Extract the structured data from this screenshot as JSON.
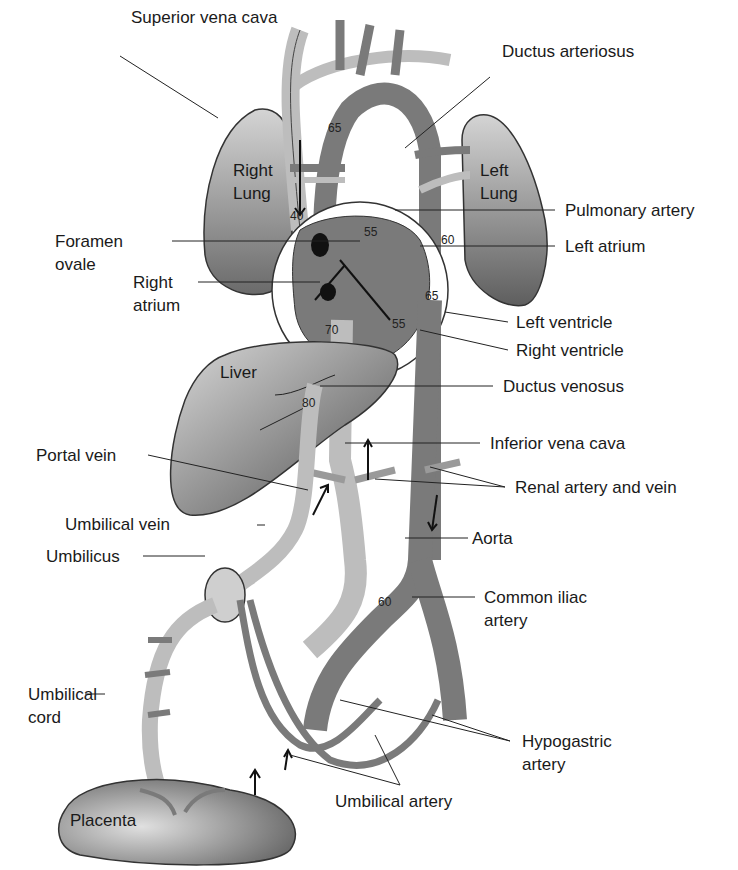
{
  "diagram": {
    "labels": {
      "superior_vena_cava": "Superior vena cava",
      "ductus_arteriosus": "Ductus arteriosus",
      "pulmonary_artery": "Pulmonary artery",
      "left_atrium": "Left atrium",
      "foramen_ovale": "Foramen",
      "foramen_ovale_2": "ovale",
      "right_atrium": "Right",
      "right_atrium_2": "atrium",
      "left_ventricle": "Left ventricle",
      "right_ventricle": "Right ventricle",
      "ductus_venosus": "Ductus venosus",
      "inferior_vena_cava": "Inferior vena cava",
      "portal_vein": "Portal vein",
      "renal": "Renal artery and vein",
      "umbilical_vein": "Umbilical vein",
      "aorta": "Aorta",
      "umbilicus": "Umbilicus",
      "common_iliac": "Common iliac",
      "common_iliac_2": "artery",
      "umbilical_cord": "Umbilical",
      "umbilical_cord_2": "cord",
      "hypogastric": "Hypogastric",
      "hypogastric_2": "artery",
      "umbilical_artery": "Umbilical artery"
    },
    "organs": {
      "right_lung": "Right",
      "right_lung_2": "Lung",
      "left_lung": "Left",
      "left_lung_2": "Lung",
      "liver": "Liver",
      "placenta": "Placenta"
    },
    "oxygen_saturation_values": {
      "aortic_arch": "65",
      "svc": "40",
      "pulmonary_trunk": "55",
      "descending_aorta_upper": "60",
      "left_ventricle": "65",
      "right_ventricle": "55",
      "ivc_upper": "70",
      "ductus_venosus": "80",
      "abdominal_aorta": "60"
    },
    "colors": {
      "oxygenated": "#bdbdbd",
      "deoxygenated": "#7a7a7a",
      "organ_dark": "#6e6e6e",
      "organ_light": "#cfcfcf",
      "line": "#222222"
    }
  }
}
